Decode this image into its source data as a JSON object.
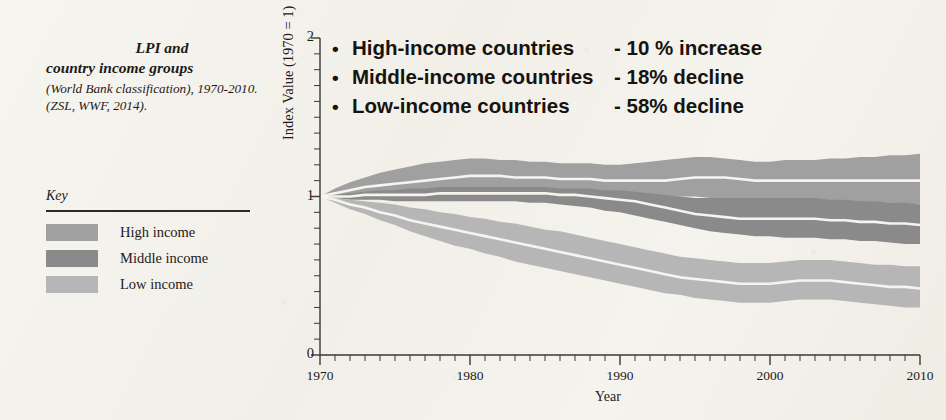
{
  "caption": {
    "line1": "LPI and",
    "line2": "country income groups",
    "rest": "(World Bank classification), 1970-2010. (ZSL, WWF, 2014)."
  },
  "key": {
    "title": "Key",
    "items": [
      {
        "label": "High income",
        "color": "#a0a0a0"
      },
      {
        "label": "Middle income",
        "color": "#8a8a8a"
      },
      {
        "label": "Low income",
        "color": "#b6b6b6"
      }
    ]
  },
  "bullets": [
    {
      "marker": "•",
      "name": "High-income countries",
      "value": "- 10 % increase"
    },
    {
      "marker": "•",
      "name": "Middle-income countries",
      "value": "- 18% decline"
    },
    {
      "marker": "•",
      "name": "Low-income countries",
      "value": "- 58% decline"
    }
  ],
  "chart_data": {
    "type": "area",
    "title": "",
    "xlabel": "Year",
    "ylabel": "Index Value (1970 = 1)",
    "xlim": [
      1970,
      2010
    ],
    "ylim": [
      0,
      2
    ],
    "yticks": [
      0,
      1,
      2
    ],
    "ytick_labels": [
      "0",
      "1",
      "2"
    ],
    "xticks": [
      1970,
      1980,
      1990,
      2000,
      2010
    ],
    "xtick_labels": [
      "1970",
      "1980",
      "1990",
      "2000",
      "2010"
    ],
    "minor_tick_interval": 1,
    "grid": false,
    "legend_position": "left-external",
    "band_style": "confidence interval with white central trend line",
    "x": [
      1970,
      1971,
      1972,
      1973,
      1974,
      1975,
      1976,
      1977,
      1978,
      1979,
      1980,
      1981,
      1982,
      1983,
      1984,
      1985,
      1986,
      1987,
      1988,
      1989,
      1990,
      1991,
      1992,
      1993,
      1994,
      1995,
      1996,
      1997,
      1998,
      1999,
      2000,
      2001,
      2002,
      2003,
      2004,
      2005,
      2006,
      2007,
      2008,
      2009,
      2010
    ],
    "series": [
      {
        "name": "High income",
        "color": "#a0a0a0",
        "final_change_pct": 10,
        "values": [
          1.0,
          1.02,
          1.04,
          1.06,
          1.07,
          1.08,
          1.09,
          1.1,
          1.11,
          1.12,
          1.13,
          1.13,
          1.13,
          1.12,
          1.12,
          1.12,
          1.11,
          1.11,
          1.11,
          1.1,
          1.1,
          1.1,
          1.1,
          1.1,
          1.11,
          1.12,
          1.12,
          1.12,
          1.11,
          1.1,
          1.1,
          1.1,
          1.1,
          1.1,
          1.1,
          1.1,
          1.1,
          1.1,
          1.1,
          1.1,
          1.1
        ],
        "upper": [
          1.0,
          1.05,
          1.09,
          1.12,
          1.15,
          1.17,
          1.19,
          1.21,
          1.22,
          1.23,
          1.24,
          1.24,
          1.23,
          1.23,
          1.22,
          1.22,
          1.21,
          1.21,
          1.21,
          1.2,
          1.2,
          1.21,
          1.22,
          1.23,
          1.24,
          1.25,
          1.25,
          1.24,
          1.23,
          1.22,
          1.22,
          1.23,
          1.23,
          1.23,
          1.24,
          1.24,
          1.25,
          1.25,
          1.26,
          1.26,
          1.27
        ],
        "lower": [
          1.0,
          1.0,
          1.0,
          1.01,
          1.01,
          1.01,
          1.02,
          1.02,
          1.02,
          1.03,
          1.03,
          1.03,
          1.03,
          1.03,
          1.03,
          1.03,
          1.02,
          1.02,
          1.02,
          1.02,
          1.01,
          1.01,
          1.01,
          1.0,
          1.0,
          1.0,
          0.99,
          0.99,
          0.98,
          0.97,
          0.97,
          0.97,
          0.97,
          0.97,
          0.97,
          0.96,
          0.96,
          0.96,
          0.96,
          0.95,
          0.95
        ]
      },
      {
        "name": "Middle income",
        "color": "#8a8a8a",
        "final_change_pct": -18,
        "values": [
          1.0,
          1.0,
          1.0,
          1.01,
          1.01,
          1.01,
          1.01,
          1.01,
          1.02,
          1.02,
          1.02,
          1.02,
          1.02,
          1.02,
          1.02,
          1.02,
          1.01,
          1.01,
          1.0,
          0.99,
          0.98,
          0.97,
          0.95,
          0.93,
          0.91,
          0.89,
          0.88,
          0.87,
          0.86,
          0.86,
          0.86,
          0.86,
          0.86,
          0.86,
          0.85,
          0.85,
          0.84,
          0.84,
          0.83,
          0.83,
          0.82
        ],
        "upper": [
          1.0,
          1.01,
          1.02,
          1.03,
          1.04,
          1.04,
          1.05,
          1.05,
          1.06,
          1.06,
          1.06,
          1.06,
          1.06,
          1.06,
          1.06,
          1.06,
          1.05,
          1.05,
          1.05,
          1.04,
          1.04,
          1.03,
          1.02,
          1.01,
          1.0,
          0.99,
          0.99,
          0.99,
          0.99,
          0.99,
          0.99,
          0.99,
          0.99,
          0.99,
          0.98,
          0.98,
          0.97,
          0.97,
          0.96,
          0.96,
          0.95
        ],
        "lower": [
          1.0,
          0.99,
          0.98,
          0.98,
          0.98,
          0.97,
          0.97,
          0.97,
          0.97,
          0.97,
          0.97,
          0.97,
          0.97,
          0.97,
          0.96,
          0.96,
          0.95,
          0.94,
          0.93,
          0.91,
          0.9,
          0.88,
          0.86,
          0.84,
          0.82,
          0.8,
          0.78,
          0.77,
          0.76,
          0.75,
          0.75,
          0.74,
          0.74,
          0.74,
          0.73,
          0.73,
          0.72,
          0.72,
          0.71,
          0.7,
          0.7
        ]
      },
      {
        "name": "Low income",
        "color": "#b6b6b6",
        "final_change_pct": -58,
        "values": [
          1.0,
          0.98,
          0.95,
          0.93,
          0.9,
          0.88,
          0.85,
          0.83,
          0.81,
          0.79,
          0.77,
          0.75,
          0.73,
          0.71,
          0.69,
          0.67,
          0.65,
          0.63,
          0.61,
          0.59,
          0.57,
          0.55,
          0.53,
          0.51,
          0.49,
          0.48,
          0.47,
          0.46,
          0.45,
          0.45,
          0.45,
          0.46,
          0.47,
          0.47,
          0.47,
          0.46,
          0.45,
          0.44,
          0.43,
          0.43,
          0.42
        ],
        "upper": [
          1.0,
          0.99,
          0.98,
          0.97,
          0.96,
          0.95,
          0.93,
          0.92,
          0.9,
          0.89,
          0.87,
          0.86,
          0.84,
          0.83,
          0.81,
          0.79,
          0.78,
          0.76,
          0.74,
          0.72,
          0.7,
          0.68,
          0.66,
          0.64,
          0.62,
          0.61,
          0.6,
          0.59,
          0.58,
          0.58,
          0.58,
          0.59,
          0.6,
          0.6,
          0.6,
          0.59,
          0.58,
          0.57,
          0.57,
          0.56,
          0.56
        ],
        "lower": [
          1.0,
          0.96,
          0.92,
          0.89,
          0.85,
          0.82,
          0.78,
          0.75,
          0.72,
          0.69,
          0.67,
          0.64,
          0.62,
          0.59,
          0.57,
          0.55,
          0.53,
          0.51,
          0.49,
          0.47,
          0.45,
          0.43,
          0.41,
          0.39,
          0.38,
          0.36,
          0.35,
          0.34,
          0.33,
          0.33,
          0.33,
          0.34,
          0.35,
          0.35,
          0.35,
          0.34,
          0.33,
          0.32,
          0.31,
          0.3,
          0.3
        ]
      }
    ]
  }
}
